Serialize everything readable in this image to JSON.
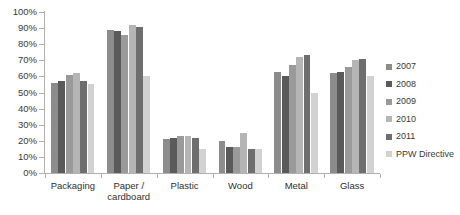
{
  "chart_data": {
    "type": "bar",
    "title": "",
    "subtitle": "",
    "xlabel": "",
    "ylabel": "",
    "ylim": [
      0,
      100
    ],
    "grid": false,
    "legend_position": "right",
    "categories": [
      "Packaging",
      "Paper / cardboard",
      "Plastic",
      "Wood",
      "Metal",
      "Glass"
    ],
    "category_lines": [
      [
        "Packaging"
      ],
      [
        "Paper /",
        "cardboard"
      ],
      [
        "Plastic"
      ],
      [
        "Wood"
      ],
      [
        "Metal"
      ],
      [
        "Glass"
      ]
    ],
    "y_ticks": [
      "0%",
      "10%",
      "20%",
      "30%",
      "40%",
      "50%",
      "60%",
      "70%",
      "80%",
      "90%",
      "100%"
    ],
    "y_tick_values": [
      0,
      10,
      20,
      30,
      40,
      50,
      60,
      70,
      80,
      90,
      100
    ],
    "series": [
      {
        "name": "2007",
        "color": "#8c8c8c",
        "values": [
          56,
          89,
          21,
          20,
          63,
          62
        ]
      },
      {
        "name": "2008",
        "color": "#5a5a5a",
        "values": [
          57,
          88,
          22,
          16,
          60,
          63
        ]
      },
      {
        "name": "2009",
        "color": "#9a9a9a",
        "values": [
          61,
          86,
          23,
          16,
          67,
          66
        ]
      },
      {
        "name": "2010",
        "color": "#b5b5b5",
        "values": [
          62,
          92,
          23,
          25,
          72,
          70
        ]
      },
      {
        "name": "2011",
        "color": "#6e6e6e",
        "values": [
          57,
          91,
          22,
          15,
          73,
          71
        ]
      },
      {
        "name": "PPW Directive",
        "color": "#d2d2d2",
        "values": [
          55,
          60,
          15,
          15,
          50,
          60
        ]
      }
    ]
  },
  "legend": {
    "items": [
      {
        "label": "2007",
        "color": "#8c8c8c"
      },
      {
        "label": "2008",
        "color": "#5a5a5a"
      },
      {
        "label": "2009",
        "color": "#9a9a9a"
      },
      {
        "label": "2010",
        "color": "#b5b5b5"
      },
      {
        "label": "2011",
        "color": "#6e6e6e"
      },
      {
        "label": "PPW Directive",
        "color": "#d2d2d2"
      }
    ]
  },
  "axis": {
    "y_max_label": "100%",
    "y_min_label": "0%"
  }
}
